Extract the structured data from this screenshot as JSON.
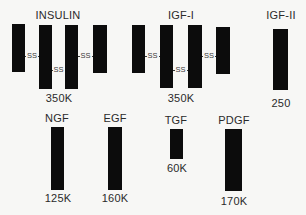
{
  "diagram": {
    "receptors": [
      {
        "name": "INSULIN",
        "mw": "350K",
        "subunits": 4,
        "bonds": [
          "SS",
          "SS",
          "SS"
        ]
      },
      {
        "name": "IGF-I",
        "mw": "350K",
        "subunits": 4,
        "bonds": [
          "SS",
          "SS",
          "SS"
        ]
      },
      {
        "name": "IGF-II",
        "mw": "250",
        "subunits": 1
      },
      {
        "name": "NGF",
        "mw": "125K",
        "subunits": 1
      },
      {
        "name": "EGF",
        "mw": "160K",
        "subunits": 1
      },
      {
        "name": "TGF",
        "mw": "60K",
        "subunits": 1
      },
      {
        "name": "PDGF",
        "mw": "170K",
        "subunits": 1
      }
    ],
    "bond_label": "SS",
    "colors": {
      "bar": "#0c0c0c",
      "background": "#f7f7f5",
      "text": "#2a2a2a"
    }
  }
}
